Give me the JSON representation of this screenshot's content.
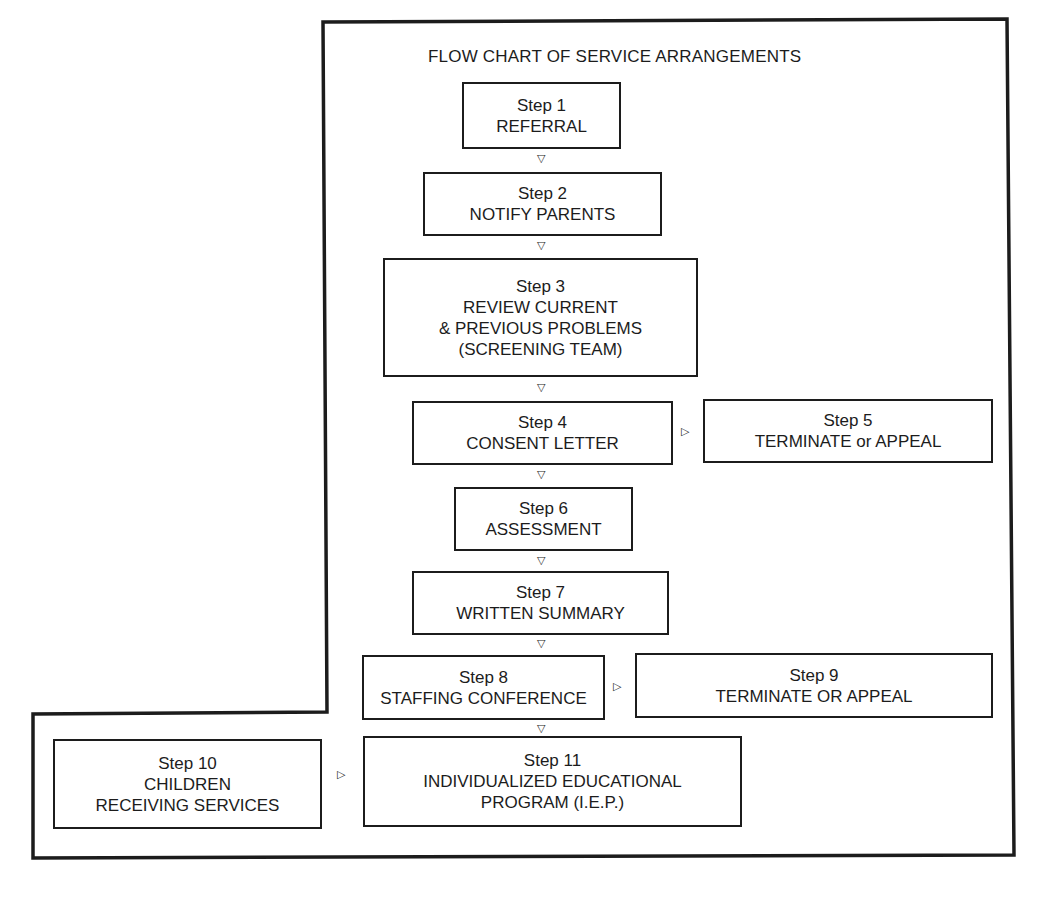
{
  "title": "FLOW CHART OF SERVICE ARRANGEMENTS",
  "steps": {
    "s1": {
      "label": "Step 1",
      "lines": [
        "REFERRAL"
      ]
    },
    "s2": {
      "label": "Step 2",
      "lines": [
        "NOTIFY PARENTS"
      ]
    },
    "s3": {
      "label": "Step 3",
      "lines": [
        "REVIEW CURRENT",
        "& PREVIOUS PROBLEMS",
        "(SCREENING TEAM)"
      ]
    },
    "s4": {
      "label": "Step 4",
      "lines": [
        "CONSENT LETTER"
      ]
    },
    "s5": {
      "label": "Step 5",
      "lines": [
        "TERMINATE or APPEAL"
      ]
    },
    "s6": {
      "label": "Step 6",
      "lines": [
        "ASSESSMENT"
      ]
    },
    "s7": {
      "label": "Step 7",
      "lines": [
        "WRITTEN SUMMARY"
      ]
    },
    "s8": {
      "label": "Step 8",
      "lines": [
        "STAFFING CONFERENCE"
      ]
    },
    "s9": {
      "label": "Step 9",
      "lines": [
        "TERMINATE OR APPEAL"
      ]
    },
    "s10": {
      "label": "Step 10",
      "lines": [
        "CHILDREN",
        "RECEIVING SERVICES"
      ]
    },
    "s11": {
      "label": "Step 11",
      "lines": [
        "INDIVIDUALIZED EDUCATIONAL",
        "PROGRAM (I.E.P.)"
      ]
    }
  },
  "arrows": {
    "down": "▽",
    "right": "▷"
  },
  "connections": [
    [
      "Step 1",
      "Step 2"
    ],
    [
      "Step 2",
      "Step 3"
    ],
    [
      "Step 3",
      "Step 4"
    ],
    [
      "Step 4",
      "Step 5"
    ],
    [
      "Step 4",
      "Step 6"
    ],
    [
      "Step 6",
      "Step 7"
    ],
    [
      "Step 7",
      "Step 8"
    ],
    [
      "Step 8",
      "Step 9"
    ],
    [
      "Step 8",
      "Step 11"
    ],
    [
      "Step 10",
      "Step 11"
    ]
  ]
}
